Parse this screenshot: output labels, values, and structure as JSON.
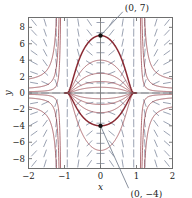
{
  "figure": {
    "kind": "slope-field-with-solution-curves",
    "background": "#ffffff",
    "frame_color": "#6e6e6e",
    "curve_color": "#8a2a33",
    "slope_dash_color": "#8a93a6",
    "text_color": "#1a1a1a",
    "leader_color": "#6b7585",
    "marker_color": "#111111"
  },
  "axes": {
    "xlabel": "x",
    "ylabel": "y",
    "xlim": [
      -2,
      2
    ],
    "ylim": [
      -9.2,
      9.2
    ],
    "xticks": [
      -2,
      -1,
      0,
      1,
      2
    ],
    "xticklabels": [
      "−2",
      "−1",
      "0",
      "1",
      "2"
    ],
    "yticks": [
      8,
      6,
      4,
      2,
      0,
      -2,
      -4,
      -6,
      -8
    ],
    "yticklabels": [
      "8",
      "6",
      "4",
      "2",
      "0",
      "−2",
      "−4",
      "−6",
      "−8"
    ],
    "grid": false
  },
  "annotations": [
    {
      "name": "point-label-top",
      "text": "(0, 7)",
      "point": [
        0,
        7
      ],
      "label_xy": [
        0.62,
        9.9
      ]
    },
    {
      "name": "point-label-bottom",
      "text": "(0, −4)",
      "point": [
        0,
        -4
      ],
      "label_xy": [
        0.78,
        -11.6
      ]
    }
  ],
  "chart_data": {
    "type": "line",
    "title": "",
    "xlabel": "x",
    "ylabel": "y",
    "xlim": [
      -2,
      2
    ],
    "ylim": [
      -9.2,
      9.2
    ],
    "grid": false,
    "legend": "none",
    "marked_points": [
      {
        "label": "(0, 7)",
        "x": 0,
        "y": 7
      },
      {
        "label": "(0, −4)",
        "x": 0,
        "y": -4
      }
    ],
    "series": [
      {
        "name": "c=7",
        "peak_x": 0,
        "peak_y": 7,
        "highlight": true
      },
      {
        "name": "c=-4",
        "peak_x": 0,
        "peak_y": -4,
        "highlight": true
      },
      {
        "name": "c=4",
        "peak_x": 0,
        "peak_y": 4,
        "highlight": false
      },
      {
        "name": "c=-7",
        "peak_x": 0,
        "peak_y": -7,
        "highlight": false
      },
      {
        "name": "c=2.4",
        "peak_x": 0,
        "peak_y": 2.4,
        "highlight": false
      },
      {
        "name": "c=-2.4",
        "peak_x": 0,
        "peak_y": -2.4,
        "highlight": false
      },
      {
        "name": "c=1.4",
        "peak_x": 0,
        "peak_y": 1.4,
        "highlight": false
      },
      {
        "name": "c=-1.4",
        "peak_x": 0,
        "peak_y": -1.4,
        "highlight": false
      },
      {
        "name": "c=0.7",
        "peak_x": 0,
        "peak_y": 0.7,
        "highlight": false
      },
      {
        "name": "c=-0.7",
        "peak_x": 0,
        "peak_y": -0.7,
        "highlight": false
      }
    ],
    "outer_branches": [
      {
        "name": "left-outer-1",
        "asymptote_x": -1.0
      },
      {
        "name": "left-outer-2",
        "asymptote_x": -1.25
      },
      {
        "name": "left-outer-3",
        "asymptote_x": -1.55
      },
      {
        "name": "right-outer-1",
        "asymptote_x": 1.0
      },
      {
        "name": "right-outer-2",
        "asymptote_x": 1.25
      },
      {
        "name": "right-outer-3",
        "asymptote_x": 1.55
      }
    ]
  }
}
